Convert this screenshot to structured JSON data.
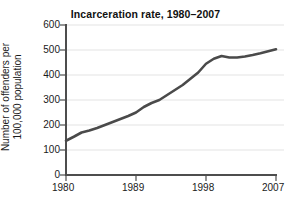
{
  "chart_data": {
    "type": "line",
    "title": "Incarceration rate, 1980–2007",
    "xlabel": "",
    "ylabel": "Number of offenders per 100,000 population",
    "ylabel_lines": [
      "Number of offenders per",
      "100,000 population"
    ],
    "xlim": [
      1980,
      2007
    ],
    "ylim": [
      0,
      600
    ],
    "xticks": [
      1980,
      1989,
      1998,
      2007
    ],
    "xtick_labels": [
      "1980",
      "1989",
      "1998",
      "2007"
    ],
    "yticks": [
      0,
      100,
      200,
      300,
      400,
      500,
      600
    ],
    "ytick_labels": [
      "0",
      "100",
      "200",
      "300",
      "400",
      "500",
      "600"
    ],
    "grid": "horizontal",
    "legend": "none",
    "line_color": "#4a4a4a",
    "line_width": 2.6,
    "axis_color": "#4d4d4d",
    "grid_color": "#e3e3e3",
    "x": [
      1980,
      1981,
      1982,
      1983,
      1984,
      1985,
      1986,
      1987,
      1988,
      1989,
      1990,
      1991,
      1992,
      1993,
      1994,
      1995,
      1996,
      1997,
      1998,
      1999,
      2000,
      2001,
      2002,
      2003,
      2004,
      2005,
      2006,
      2007
    ],
    "values": [
      137,
      153,
      170,
      178,
      188,
      200,
      212,
      224,
      236,
      250,
      272,
      288,
      300,
      320,
      340,
      360,
      385,
      410,
      445,
      465,
      476,
      470,
      470,
      474,
      480,
      487,
      495,
      503
    ],
    "series": [
      {
        "name": "Incarceration rate",
        "values": [
          137,
          153,
          170,
          178,
          188,
          200,
          212,
          224,
          236,
          250,
          272,
          288,
          300,
          320,
          340,
          360,
          385,
          410,
          445,
          465,
          476,
          470,
          470,
          474,
          480,
          487,
          495,
          503
        ]
      }
    ]
  }
}
